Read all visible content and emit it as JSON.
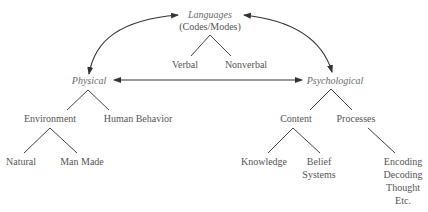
{
  "diagram": {
    "root": {
      "label": "Languages",
      "sublabel": "(Codes/Modes)",
      "children": [
        "Verbal",
        "Nonverbal"
      ]
    },
    "physical": {
      "label": "Physical",
      "children": {
        "environment": {
          "label": "Environment",
          "children": [
            "Natural",
            "Man Made"
          ]
        },
        "human_behavior": {
          "label": "Human Behavior"
        }
      }
    },
    "psychological": {
      "label": "Psychological",
      "children": {
        "content": {
          "label": "Content",
          "children": [
            "Knowledge",
            "Belief",
            "Systems"
          ]
        },
        "processes": {
          "label": "Processes",
          "children": [
            "Encoding",
            "Decoding",
            "Thought",
            "Etc."
          ]
        }
      }
    },
    "relations": [
      {
        "from": "Languages",
        "to": "Physical",
        "type": "bidirectional-curved"
      },
      {
        "from": "Languages",
        "to": "Psychological",
        "type": "bidirectional-curved"
      },
      {
        "from": "Physical",
        "to": "Psychological",
        "type": "bidirectional-straight"
      }
    ],
    "colors": {
      "text": "#555555",
      "lines": "#444444",
      "background": "#ffffff"
    }
  }
}
